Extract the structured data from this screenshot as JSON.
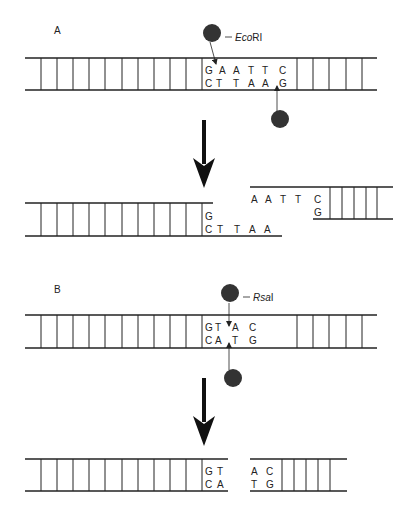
{
  "panels": {
    "A": {
      "label": "A",
      "enzyme": {
        "name_italic": "Eco",
        "name_roman": "RI"
      },
      "site": {
        "top": [
          "G",
          "A",
          "A",
          "T",
          "T",
          "C"
        ],
        "bottom": [
          "C",
          "T",
          "T",
          "A",
          "A",
          "G"
        ]
      },
      "products": {
        "left": {
          "top": [
            "G"
          ],
          "bottom": [
            "C",
            "T",
            "T",
            "A",
            "A"
          ]
        },
        "right": {
          "top": [
            "A",
            "A",
            "T",
            "T",
            "C"
          ],
          "bottom": [
            "G"
          ]
        }
      },
      "cut_type": "sticky ends"
    },
    "B": {
      "label": "B",
      "enzyme": {
        "name_italic": "Rsa",
        "name_roman": "I"
      },
      "site": {
        "top": [
          "G",
          "T",
          "A",
          "C"
        ],
        "bottom": [
          "C",
          "A",
          "T",
          "G"
        ]
      },
      "products": {
        "left": {
          "top": [
            "G",
            "T"
          ],
          "bottom": [
            "C",
            "A"
          ]
        },
        "right": {
          "top": [
            "A",
            "C"
          ],
          "bottom": [
            "T",
            "G"
          ]
        }
      },
      "cut_type": "blunt ends"
    }
  },
  "colors": {
    "ink": "#222222",
    "enzyme": "#333333",
    "background": "#ffffff"
  }
}
